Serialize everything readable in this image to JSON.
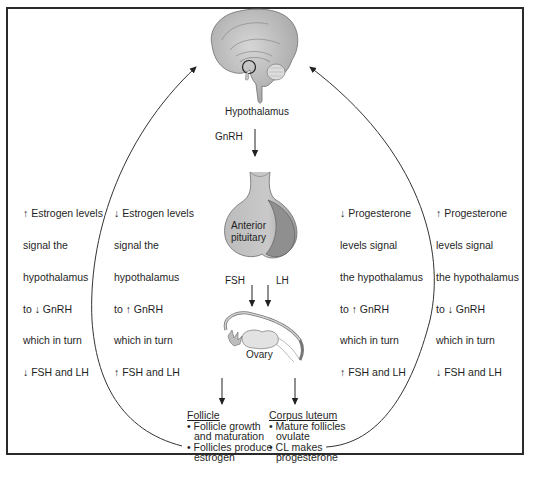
{
  "diagram": {
    "nodes": {
      "hypothalamus": "Hypothalamus",
      "pituitary_line1": "Anterior",
      "pituitary_line2": "pituitary",
      "ovary": "Ovary"
    },
    "hormones": {
      "gnrh": "GnRH",
      "fsh": "FSH",
      "lh": "LH"
    },
    "feedback": {
      "estrogen_high": [
        "↑ Estrogen levels",
        "signal the",
        "hypothalamus",
        "to ↓ GnRH",
        "which in turn",
        "↓ FSH and LH"
      ],
      "estrogen_low": [
        "↓ Estrogen levels",
        "signal the",
        "hypothalamus",
        "to ↑ GnRH",
        "which in turn",
        "↑ FSH and LH"
      ],
      "progesterone_low": [
        "↓ Progesterone",
        "levels signal",
        "the hypothalamus",
        "to ↑ GnRH",
        "which in turn",
        "↑ FSH and LH"
      ],
      "progesterone_high": [
        "↑ Progesterone",
        "levels signal",
        "the hypothalamus",
        "to ↓ GnRH",
        "which in turn",
        "↓ FSH and LH"
      ]
    },
    "outcomes": {
      "follicle": {
        "heading": "Follicle",
        "bullets": [
          "• Follicle growth and maturation",
          "• Follicles produce estrogen"
        ],
        "lines": [
          "• Follicle growth",
          "and maturation",
          "• Follicles produce",
          "estrogen"
        ]
      },
      "corpus_luteum": {
        "heading": "Corpus luteum",
        "bullets": [
          "• Mature follicles ovulate",
          "• CL makes progesterone"
        ],
        "lines": [
          "• Mature follicles",
          "ovulate",
          "• CL makes",
          "progesterone"
        ]
      }
    },
    "colors": {
      "frame": "#2a2a2a",
      "line": "#333333",
      "organ_fill": "#bdbdbd",
      "organ_dark": "#8a8a8a"
    }
  }
}
